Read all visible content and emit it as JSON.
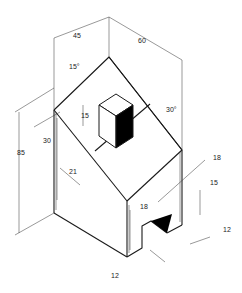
{
  "drawing": {
    "type": "isometric-technical-drawing",
    "subject": "house-shaped block with roof cube and notched base",
    "dimensions": [
      {
        "id": "width-left",
        "value": "45"
      },
      {
        "id": "width-right",
        "value": "60"
      },
      {
        "id": "roof-angle-left",
        "value": "15°"
      },
      {
        "id": "roof-angle-right",
        "value": "30°"
      },
      {
        "id": "cube-height",
        "value": "15"
      },
      {
        "id": "left-offset",
        "value": "30"
      },
      {
        "id": "overall-height",
        "value": "85"
      },
      {
        "id": "roof-offset",
        "value": "21"
      },
      {
        "id": "right-top",
        "value": "18"
      },
      {
        "id": "right-mid",
        "value": "18"
      },
      {
        "id": "notch-height",
        "value": "15"
      },
      {
        "id": "notch-depth-right",
        "value": "12"
      },
      {
        "id": "notch-width-bottom",
        "value": "12"
      }
    ]
  },
  "colors": {
    "line": "#1a1a1a",
    "shade": "#000000",
    "background": "#ffffff"
  }
}
